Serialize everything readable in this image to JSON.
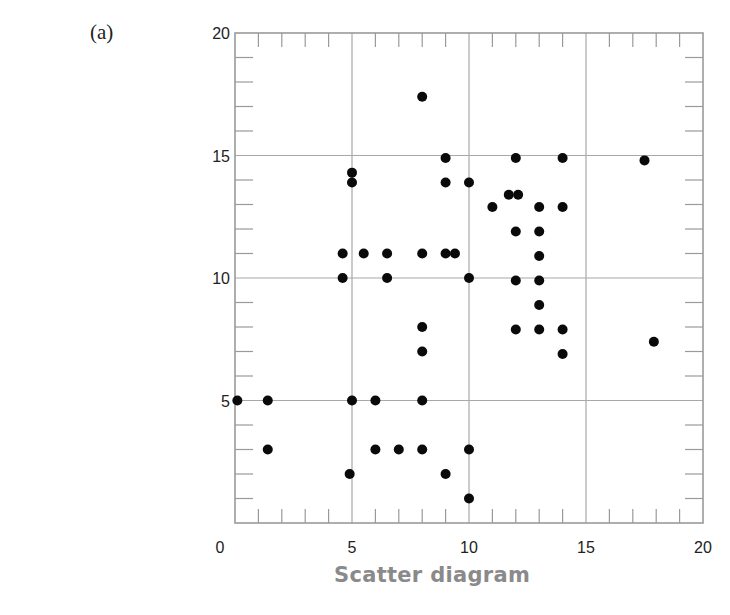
{
  "panel_label": "(a)",
  "caption": "Scatter diagram",
  "chart_data": {
    "type": "scatter",
    "title": "Scatter diagram",
    "panel": "(a)",
    "xlabel": "",
    "ylabel": "",
    "xlim": [
      0,
      20
    ],
    "ylim": [
      0,
      20
    ],
    "x_ticks": [
      0,
      5,
      10,
      15,
      20
    ],
    "y_ticks": [
      5,
      10,
      15,
      20
    ],
    "x_tick_labels": [
      "0",
      "5",
      "10",
      "15",
      "20"
    ],
    "y_tick_labels": [
      "5",
      "10",
      "15",
      "20"
    ],
    "minor_tick_step": 1,
    "grid": true,
    "grid_step": 5,
    "legend": null,
    "series": [
      {
        "name": "points",
        "points": [
          {
            "x": 0.1,
            "y": 5
          },
          {
            "x": 1.4,
            "y": 5
          },
          {
            "x": 1.4,
            "y": 3
          },
          {
            "x": 4.9,
            "y": 2
          },
          {
            "x": 5,
            "y": 5
          },
          {
            "x": 6,
            "y": 5
          },
          {
            "x": 6,
            "y": 3
          },
          {
            "x": 7,
            "y": 3
          },
          {
            "x": 8,
            "y": 5
          },
          {
            "x": 8,
            "y": 3
          },
          {
            "x": 9,
            "y": 2
          },
          {
            "x": 10,
            "y": 3
          },
          {
            "x": 10,
            "y": 1
          },
          {
            "x": 8,
            "y": 7
          },
          {
            "x": 8,
            "y": 8
          },
          {
            "x": 4.6,
            "y": 10
          },
          {
            "x": 4.6,
            "y": 11
          },
          {
            "x": 5.5,
            "y": 11
          },
          {
            "x": 6.5,
            "y": 11
          },
          {
            "x": 6.5,
            "y": 10
          },
          {
            "x": 8,
            "y": 11
          },
          {
            "x": 9,
            "y": 11
          },
          {
            "x": 9.4,
            "y": 11
          },
          {
            "x": 10,
            "y": 10
          },
          {
            "x": 5,
            "y": 14.3
          },
          {
            "x": 5,
            "y": 13.9
          },
          {
            "x": 8,
            "y": 17.4
          },
          {
            "x": 9,
            "y": 14.9
          },
          {
            "x": 9,
            "y": 13.9
          },
          {
            "x": 10,
            "y": 13.9
          },
          {
            "x": 11,
            "y": 12.9
          },
          {
            "x": 11.7,
            "y": 13.4
          },
          {
            "x": 12.1,
            "y": 13.4
          },
          {
            "x": 12,
            "y": 14.9
          },
          {
            "x": 14,
            "y": 14.9
          },
          {
            "x": 17.5,
            "y": 14.8
          },
          {
            "x": 13,
            "y": 12.9
          },
          {
            "x": 14,
            "y": 12.9
          },
          {
            "x": 12,
            "y": 11.9
          },
          {
            "x": 13,
            "y": 11.9
          },
          {
            "x": 13,
            "y": 10.9
          },
          {
            "x": 12,
            "y": 9.9
          },
          {
            "x": 13,
            "y": 9.9
          },
          {
            "x": 13,
            "y": 8.9
          },
          {
            "x": 12,
            "y": 7.9
          },
          {
            "x": 13,
            "y": 7.9
          },
          {
            "x": 14,
            "y": 7.9
          },
          {
            "x": 14,
            "y": 6.9
          },
          {
            "x": 17.9,
            "y": 7.4
          }
        ]
      }
    ]
  },
  "colors": {
    "axis": "#9a9a9a",
    "grid": "#a8a8a8",
    "point": "#0a0a0a",
    "caption": "#8a8a8a",
    "tick_label": "#222222"
  }
}
